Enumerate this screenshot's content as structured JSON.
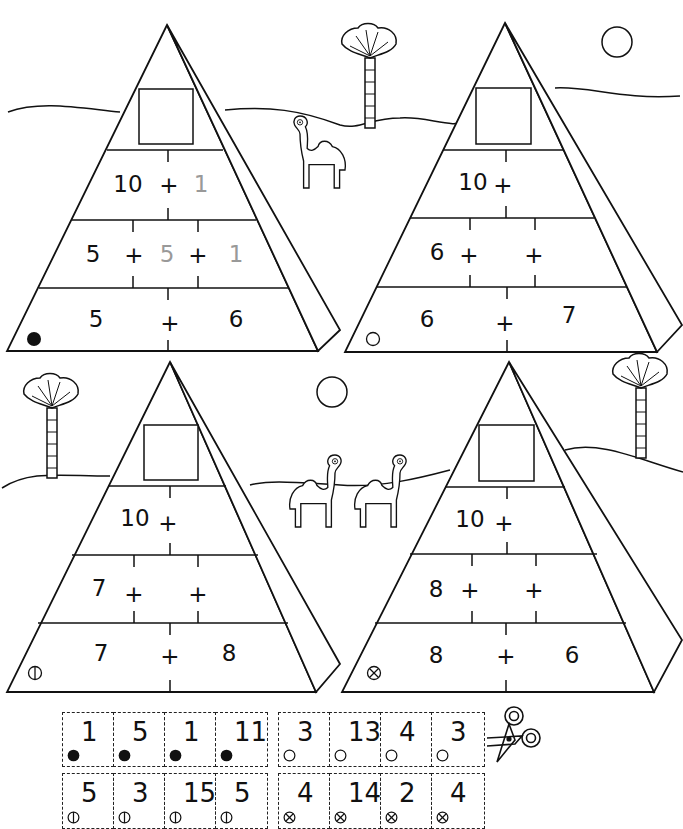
{
  "pyramids": [
    {
      "id": "p1",
      "marker": "filled-circle",
      "row1": {
        "left": "10",
        "plus": "+",
        "right": "1",
        "right_faint": true
      },
      "row2": {
        "a": "5",
        "plus1": "+",
        "b": "5",
        "plus2": "+",
        "c": "1",
        "b_faint": true,
        "c_faint": true
      },
      "row3": {
        "left": "5",
        "plus": "+",
        "right": "6"
      }
    },
    {
      "id": "p2",
      "marker": "empty-circle",
      "row1": {
        "left": "10",
        "plus": "+",
        "right": ""
      },
      "row2": {
        "a": "6",
        "plus1": "+",
        "b": "",
        "plus2": "+",
        "c": ""
      },
      "row3": {
        "left": "6",
        "plus": "+",
        "right": "7"
      }
    },
    {
      "id": "p3",
      "marker": "vertical-bar-circle",
      "row1": {
        "left": "10",
        "plus": "+",
        "right": ""
      },
      "row2": {
        "a": "7",
        "plus1": "+",
        "b": "",
        "plus2": "+",
        "c": ""
      },
      "row3": {
        "left": "7",
        "plus": "+",
        "right": "8"
      }
    },
    {
      "id": "p4",
      "marker": "x-circle",
      "row1": {
        "left": "10",
        "plus": "+",
        "right": ""
      },
      "row2": {
        "a": "8",
        "plus1": "+",
        "b": "",
        "plus2": "+",
        "c": ""
      },
      "row3": {
        "left": "8",
        "plus": "+",
        "right": "6"
      }
    }
  ],
  "cards": {
    "row1": [
      {
        "marker": "filled-circle",
        "value": "1"
      },
      {
        "marker": "filled-circle",
        "value": "5"
      },
      {
        "marker": "filled-circle",
        "value": "1"
      },
      {
        "marker": "filled-circle",
        "value": "11"
      },
      {
        "marker": "empty-circle",
        "value": "3"
      },
      {
        "marker": "empty-circle",
        "value": "13"
      },
      {
        "marker": "empty-circle",
        "value": "4"
      },
      {
        "marker": "empty-circle",
        "value": "3"
      }
    ],
    "row2": [
      {
        "marker": "vertical-bar-circle",
        "value": "5"
      },
      {
        "marker": "vertical-bar-circle",
        "value": "3"
      },
      {
        "marker": "vertical-bar-circle",
        "value": "15"
      },
      {
        "marker": "vertical-bar-circle",
        "value": "5"
      },
      {
        "marker": "x-circle",
        "value": "4"
      },
      {
        "marker": "x-circle",
        "value": "14"
      },
      {
        "marker": "x-circle",
        "value": "2"
      },
      {
        "marker": "x-circle",
        "value": "4"
      }
    ]
  },
  "icons": {
    "scissors": "scissors-icon",
    "sun": "sun-icon",
    "palm": "palm-tree-icon",
    "camel": "camel-icon"
  }
}
